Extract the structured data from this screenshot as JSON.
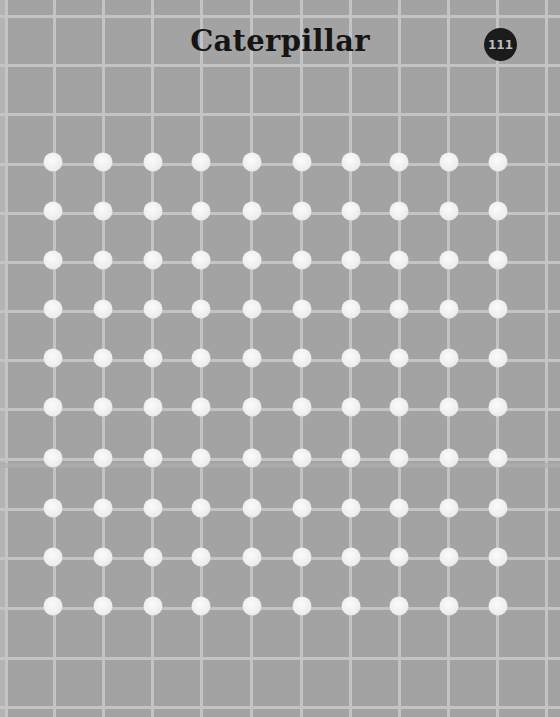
{
  "page": {
    "title": "Caterpillar",
    "page_number": "111"
  },
  "colors": {
    "background": "#a3a3a3",
    "grid_line": "#c4c4c4",
    "dot": "#f2f2f2",
    "badge": "#1b1b1b",
    "title_text": "#151515"
  },
  "grid": {
    "vertical_lines_x": [
      6,
      54,
      103,
      152,
      201,
      251,
      301,
      350,
      399,
      448,
      497,
      546
    ],
    "horizontal_lines_y": [
      16,
      65,
      114,
      164,
      213,
      262,
      311,
      360,
      409,
      459,
      509,
      558,
      608,
      658,
      707
    ]
  },
  "dots": {
    "columns_x": [
      53,
      103,
      153,
      201,
      252,
      302,
      351,
      399,
      449,
      498
    ],
    "rows_y": [
      162,
      211,
      260,
      309,
      358,
      407,
      458,
      508,
      557,
      606
    ],
    "count": 100
  }
}
